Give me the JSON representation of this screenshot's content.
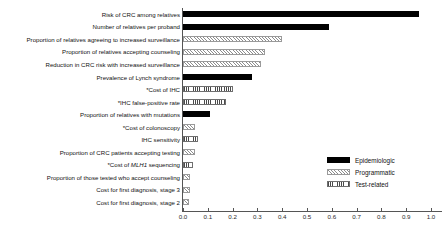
{
  "chart_data": {
    "type": "bar",
    "orientation": "horizontal",
    "title": "",
    "xlabel": "",
    "ylabel": "",
    "xlim": [
      0.0,
      1.0
    ],
    "xticks": [
      "0.0",
      "0.1",
      "0.2",
      "0.3",
      "0.4",
      "0.5",
      "0.6",
      "0.7",
      "0.8",
      "0.9",
      "1.0"
    ],
    "grid": false,
    "legend_position": "center-right",
    "categories": [
      "Risk of CRC among relatives",
      "Number of relatives per proband",
      "Proportion of relatives agreeing to increased surveillance",
      "Proportion of relatives accepting counseling",
      "Reduction in CRC risk with increased surveillance",
      "Prevalence of Lynch syndrome",
      "*Cost of IHC",
      "*IHC false-positive rate",
      "Proportion of relatives with mutations",
      "*Cost of colonoscopy",
      "IHC sensitivity",
      "Proportion of CRC patients accepting testing",
      "*Cost of MLH1 sequencing",
      "Proportion of those tested who accept counseling",
      "Cost for first diagnosis, stage 3",
      "Cost for first diagnosis, stage 2"
    ],
    "values": [
      0.95,
      0.59,
      0.4,
      0.33,
      0.315,
      0.28,
      0.2,
      0.175,
      0.11,
      0.05,
      0.06,
      0.05,
      0.04,
      0.03,
      0.028,
      0.025
    ],
    "groups": [
      "Epidemiologic",
      "Epidemiologic",
      "Programmatic",
      "Programmatic",
      "Programmatic",
      "Epidemiologic",
      "Test-related",
      "Test-related",
      "Epidemiologic",
      "Programmatic",
      "Test-related",
      "Programmatic",
      "Test-related",
      "Programmatic",
      "Programmatic",
      "Programmatic"
    ],
    "series": [
      {
        "name": "Epidemiologic",
        "pattern": "solid-black",
        "color": "#000000",
        "points": [
          {
            "category": "Risk of CRC among relatives",
            "value": 0.95
          },
          {
            "category": "Number of relatives per proband",
            "value": 0.59
          },
          {
            "category": "Prevalence of Lynch syndrome",
            "value": 0.28
          },
          {
            "category": "Proportion of relatives with mutations",
            "value": 0.11
          }
        ]
      },
      {
        "name": "Programmatic",
        "pattern": "diagonal-hatch",
        "color": "#8d8d8d",
        "points": [
          {
            "category": "Proportion of relatives agreeing to increased surveillance",
            "value": 0.4
          },
          {
            "category": "Proportion of relatives accepting counseling",
            "value": 0.33
          },
          {
            "category": "Reduction in CRC risk with increased surveillance",
            "value": 0.315
          },
          {
            "category": "*Cost of colonoscopy",
            "value": 0.05
          },
          {
            "category": "Proportion of CRC patients accepting testing",
            "value": 0.05
          },
          {
            "category": "Proportion of those tested who accept counseling",
            "value": 0.03
          },
          {
            "category": "Cost for first diagnosis, stage 3",
            "value": 0.028
          },
          {
            "category": "Cost for first diagnosis, stage 2",
            "value": 0.025
          }
        ]
      },
      {
        "name": "Test-related",
        "pattern": "vertical-hatch",
        "color": "#4a4a4a",
        "points": [
          {
            "category": "*Cost of IHC",
            "value": 0.2
          },
          {
            "category": "*IHC false-positive rate",
            "value": 0.175
          },
          {
            "category": "IHC sensitivity",
            "value": 0.06
          },
          {
            "category": "*Cost of MLH1 sequencing",
            "value": 0.04
          }
        ]
      }
    ]
  },
  "rows": [
    {
      "label": "Risk of CRC among relatives",
      "value": 0.95,
      "group": "epidemiologic"
    },
    {
      "label": "Number of relatives per proband",
      "value": 0.59,
      "group": "epidemiologic"
    },
    {
      "label": "Proportion of relatives agreeing to increased surveillance",
      "value": 0.4,
      "group": "programmatic"
    },
    {
      "label": "Proportion of relatives accepting counseling",
      "value": 0.33,
      "group": "programmatic"
    },
    {
      "label": "Reduction in CRC risk with increased surveillance",
      "value": 0.315,
      "group": "programmatic"
    },
    {
      "label": "Prevalence of Lynch syndrome",
      "value": 0.28,
      "group": "epidemiologic"
    },
    {
      "label": "*Cost of IHC",
      "value": 0.2,
      "group": "test-related"
    },
    {
      "label": "*IHC false-positive rate",
      "value": 0.175,
      "group": "test-related"
    },
    {
      "label": "Proportion of relatives with mutations",
      "value": 0.11,
      "group": "epidemiologic"
    },
    {
      "label": "*Cost of colonoscopy",
      "value": 0.05,
      "group": "programmatic"
    },
    {
      "label": "IHC sensitivity",
      "value": 0.06,
      "group": "test-related"
    },
    {
      "label": "Proportion of CRC patients accepting testing",
      "value": 0.05,
      "group": "programmatic"
    },
    {
      "label": "*Cost of MLH1 sequencing",
      "value": 0.04,
      "group": "test-related",
      "italic_part": "MLH1"
    },
    {
      "label": "Proportion of those tested who accept counseling",
      "value": 0.03,
      "group": "programmatic"
    },
    {
      "label": "Cost for first diagnosis, stage 3",
      "value": 0.028,
      "group": "programmatic"
    },
    {
      "label": "Cost for first diagnosis, stage 2",
      "value": 0.025,
      "group": "programmatic"
    }
  ],
  "axis": {
    "ticks": [
      "0.0",
      "0.1",
      "0.2",
      "0.3",
      "0.4",
      "0.5",
      "0.6",
      "0.7",
      "0.8",
      "0.9",
      "1.0"
    ],
    "min": 0.0,
    "max": 1.0
  },
  "legend": {
    "items": [
      {
        "label": "Epidemiologic",
        "pattern": "epidemiologic"
      },
      {
        "label": "Programmatic",
        "pattern": "programmatic"
      },
      {
        "label": "Test-related",
        "pattern": "test-related"
      }
    ]
  }
}
